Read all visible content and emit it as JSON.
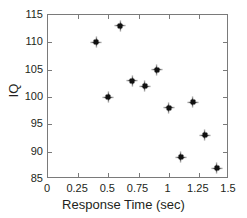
{
  "chart_data": {
    "type": "scatter",
    "title": "",
    "xlabel": "Response Time (sec)",
    "ylabel": "IQ",
    "xlim": [
      0,
      1.5
    ],
    "ylim": [
      85,
      115
    ],
    "grid": false,
    "legend": null,
    "marker_style": "plus-star",
    "marker_color": "#111111",
    "axis_color": "#7a7a7a",
    "text_color": "#231f20",
    "xticks": [
      0,
      0.25,
      0.5,
      0.75,
      1,
      1.25,
      1.5
    ],
    "xtick_labels": [
      "0",
      "0.25",
      "0.5",
      "0.75",
      "1",
      "1.25",
      "1.5"
    ],
    "yticks": [
      85,
      90,
      95,
      100,
      105,
      110,
      115
    ],
    "ytick_labels": [
      "85",
      "90",
      "95",
      "100",
      "105",
      "110",
      "115"
    ],
    "points": [
      {
        "x": 0.4,
        "y": 110
      },
      {
        "x": 0.5,
        "y": 100
      },
      {
        "x": 0.6,
        "y": 113
      },
      {
        "x": 0.7,
        "y": 103
      },
      {
        "x": 0.8,
        "y": 102
      },
      {
        "x": 0.9,
        "y": 105
      },
      {
        "x": 1.0,
        "y": 98
      },
      {
        "x": 1.1,
        "y": 89
      },
      {
        "x": 1.2,
        "y": 99
      },
      {
        "x": 1.3,
        "y": 93
      },
      {
        "x": 1.4,
        "y": 87
      }
    ]
  }
}
